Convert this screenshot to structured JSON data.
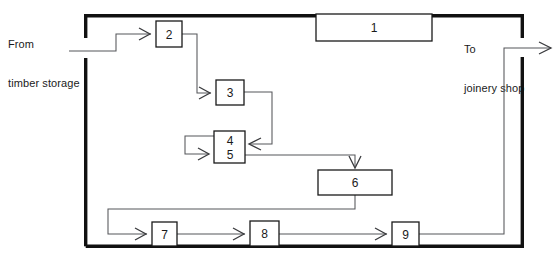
{
  "diagram": {
    "type": "process-flow",
    "canvas": {
      "width": 558,
      "height": 258
    },
    "colors": {
      "frame": "#111111",
      "node_stroke": "#1a1a1a",
      "connector": "#55565a",
      "text": "#1a1a1a",
      "background": "#ffffff"
    },
    "external_labels": {
      "input": "From\ntimber storage",
      "input_line1": "From",
      "input_line2": "timber storage",
      "output": "To\njoinery shop",
      "output_line1": "To",
      "output_line2": "joinery shop"
    },
    "frame": {
      "x": 84,
      "y": 14,
      "width": 440,
      "height": 234,
      "gaps": [
        {
          "side": "left",
          "from": 38,
          "to": 58
        },
        {
          "side": "right",
          "from": 38,
          "to": 54
        }
      ]
    },
    "nodes": [
      {
        "id": "n1",
        "label": "1",
        "x": 316,
        "y": 14,
        "width": 116,
        "height": 27
      },
      {
        "id": "n2",
        "label": "2",
        "x": 156,
        "y": 21,
        "width": 26,
        "height": 26
      },
      {
        "id": "n3",
        "label": "3",
        "x": 216,
        "y": 80,
        "width": 28,
        "height": 25
      },
      {
        "id": "n45",
        "label": "4\n5",
        "label_top": "4",
        "label_bottom": "5",
        "x": 214,
        "y": 131,
        "width": 31,
        "height": 32
      },
      {
        "id": "n6",
        "label": "6",
        "x": 318,
        "y": 170,
        "width": 74,
        "height": 25
      },
      {
        "id": "n7",
        "label": "7",
        "x": 152,
        "y": 222,
        "width": 25,
        "height": 24
      },
      {
        "id": "n8",
        "label": "8",
        "x": 250,
        "y": 221,
        "width": 29,
        "height": 25
      },
      {
        "id": "n9",
        "label": "9",
        "x": 392,
        "y": 222,
        "width": 27,
        "height": 24
      }
    ],
    "connections": [
      {
        "id": "c-in-2",
        "from": "input",
        "to": "n2",
        "arrow": true
      },
      {
        "id": "c-2-3",
        "from": "n2",
        "to": "n3",
        "arrow": true
      },
      {
        "id": "c-3-45",
        "from": "n3",
        "to": "n45",
        "arrow": true
      },
      {
        "id": "c-45-loop",
        "from": "n45",
        "to": "n45",
        "arrow": true
      },
      {
        "id": "c-45-6",
        "from": "n45",
        "to": "n6",
        "arrow": true
      },
      {
        "id": "c-6-7",
        "from": "n6",
        "to": "n7",
        "arrow": true
      },
      {
        "id": "c-7-8",
        "from": "n7",
        "to": "n8",
        "arrow": true
      },
      {
        "id": "c-8-9",
        "from": "n8",
        "to": "n9",
        "arrow": true
      },
      {
        "id": "c-9-out",
        "from": "n9",
        "to": "output",
        "arrow": true
      }
    ]
  }
}
